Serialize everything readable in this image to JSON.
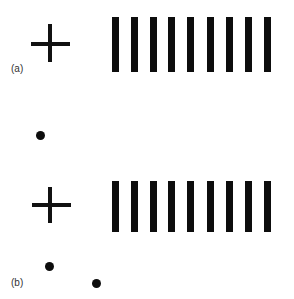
{
  "figure": {
    "panels": [
      {
        "label": "(a)",
        "fixation_cross": true,
        "grating_bar_count": 9,
        "dots": [
          {
            "cx": 40,
            "cy": 135
          }
        ]
      },
      {
        "label": "(b)",
        "fixation_cross": true,
        "grating_bar_count": 9,
        "dots": [
          {
            "cx": 49,
            "cy": 266
          },
          {
            "cx": 96,
            "cy": 283
          }
        ]
      }
    ],
    "colors": {
      "foreground": "#0d0d0d",
      "background": "#ffffff"
    }
  }
}
